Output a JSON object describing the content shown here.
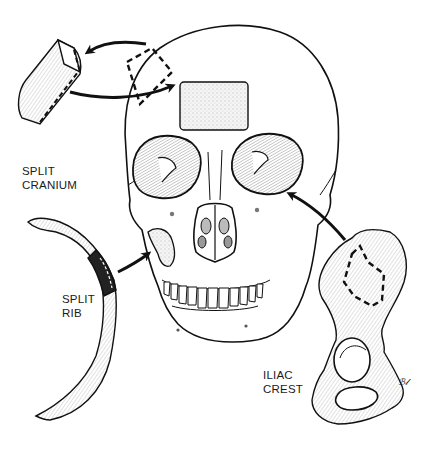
{
  "figure": {
    "labels": {
      "split_cranium": {
        "line1": "SPLIT",
        "line2": "CRANIUM"
      },
      "split_rib": {
        "line1": "SPLIT",
        "line2": "RIB"
      },
      "iliac_crest": {
        "line1": "ILIAC",
        "line2": "CREST"
      }
    },
    "signature": "ℬ𝓁",
    "colors": {
      "ink": "#111111",
      "background": "#ffffff",
      "graft_fill": "#eeeeee"
    }
  }
}
